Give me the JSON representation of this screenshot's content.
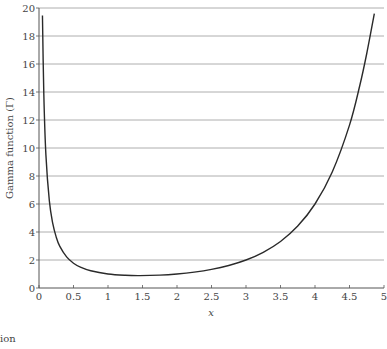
{
  "chart_data": {
    "type": "line",
    "title": "",
    "xlabel": "x",
    "ylabel": "Gamma function (Γ)",
    "xlim": [
      0,
      5
    ],
    "ylim": [
      0,
      20
    ],
    "grid": "horizontal",
    "legend": null,
    "x_ticks": [
      "0",
      "0.5",
      "1",
      "1.5",
      "2",
      "2.5",
      "3",
      "3.5",
      "4",
      "4.5",
      "5"
    ],
    "y_ticks": [
      "0",
      "2",
      "4",
      "6",
      "8",
      "10",
      "12",
      "14",
      "16",
      "18",
      "20"
    ],
    "series": [
      {
        "name": "Gamma function",
        "x": [
          0.05,
          0.07,
          0.1,
          0.15,
          0.2,
          0.25,
          0.3,
          0.4,
          0.5,
          0.6,
          0.75,
          1.0,
          1.25,
          1.46,
          1.75,
          2.0,
          2.25,
          2.5,
          2.75,
          3.0,
          3.25,
          3.5,
          3.75,
          4.0,
          4.25,
          4.5,
          4.65,
          4.75,
          4.86
        ],
        "y": [
          19.47,
          13.82,
          9.51,
          6.22,
          4.59,
          3.63,
          2.99,
          2.22,
          1.77,
          1.49,
          1.23,
          1.0,
          0.906,
          0.886,
          0.919,
          1.0,
          1.133,
          1.329,
          1.608,
          2.0,
          2.549,
          3.323,
          4.423,
          6.0,
          8.285,
          11.632,
          14.48,
          16.75,
          19.6
        ]
      }
    ]
  },
  "caption": "tion"
}
